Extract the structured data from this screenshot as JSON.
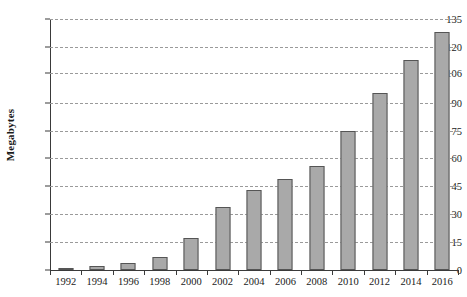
{
  "chart_data": {
    "type": "bar",
    "title": "",
    "xlabel": "",
    "ylabel": "Megabytes",
    "categories": [
      "1992",
      "1994",
      "1996",
      "1998",
      "2000",
      "2002",
      "2004",
      "2006",
      "2008",
      "2010",
      "2012",
      "2014",
      "2016"
    ],
    "values": [
      1,
      2,
      4,
      7,
      17,
      34,
      43,
      49,
      56,
      75,
      95,
      113,
      128
    ],
    "ylim": [
      0,
      135
    ],
    "xlim": [
      "1991",
      "2017"
    ],
    "yticks": [
      0,
      15,
      30,
      45,
      60,
      75,
      90,
      106,
      120,
      135
    ],
    "ytick_labels": [
      "0",
      "15",
      "30",
      "45",
      "60",
      "75",
      "90",
      "106",
      "120",
      "135"
    ],
    "xtick_labels": [
      "1992",
      "1994",
      "1996",
      "1998",
      "2000",
      "2002",
      "2004",
      "2006",
      "2008",
      "2010",
      "2012",
      "2014",
      "2016"
    ],
    "grid": true,
    "grid_axis": "y",
    "grid_style": "dashed",
    "legend": false,
    "legend_position": "none",
    "series": [
      {
        "name": "Megabytes",
        "values": [
          1,
          2,
          4,
          7,
          17,
          34,
          43,
          49,
          56,
          75,
          95,
          113,
          128
        ]
      }
    ],
    "colors": {
      "bar_fill": "#a9a9a9",
      "bar_border": "#555555",
      "gridline": "#9a9a9a",
      "axis": "#3a3a3a",
      "text": "#1a1a1a",
      "background": "#ffffff"
    }
  }
}
